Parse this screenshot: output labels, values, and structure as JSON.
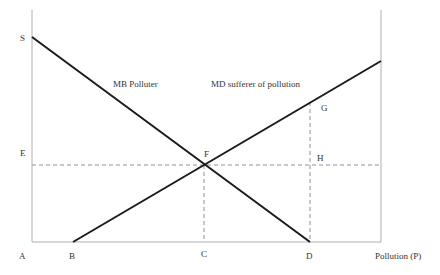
{
  "diagram": {
    "type": "economics-externality",
    "axes": {
      "x_label": "Pollution (P)",
      "origin_label": "A"
    },
    "curves": [
      {
        "id": "mb",
        "label": "MB Polluter",
        "from": "S",
        "to": "D",
        "style": "solid"
      },
      {
        "id": "md",
        "label": "MD sufferer of pollution",
        "from": "B",
        "to": "upper-right",
        "style": "solid"
      }
    ],
    "points": {
      "S": "S",
      "E": "E",
      "A": "A",
      "B": "B",
      "C": "C",
      "D": "D",
      "F": "F",
      "G": "G",
      "H": "H"
    },
    "guides": [
      {
        "id": "E-F-H",
        "orientation": "horizontal",
        "style": "dashed",
        "through": [
          "E",
          "F",
          "H"
        ]
      },
      {
        "id": "F-C",
        "orientation": "vertical",
        "style": "dashed",
        "through": [
          "F",
          "C"
        ]
      },
      {
        "id": "G-D",
        "orientation": "vertical",
        "style": "dashed",
        "through": [
          "G",
          "H",
          "D"
        ]
      }
    ],
    "colors": {
      "axis": "#b0b0b0",
      "curve": "#1a1a1a",
      "guide": "#777777",
      "text": "#333333"
    }
  }
}
